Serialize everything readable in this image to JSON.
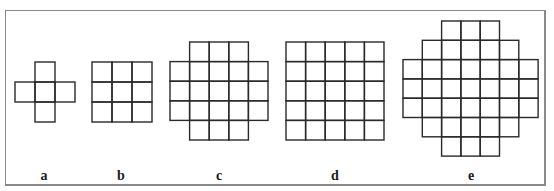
{
  "figure": {
    "line_color": "#2a2a2a",
    "frame_color": "#8a8a8a",
    "shapes": [
      {
        "id": "a",
        "label": "a",
        "origin": [
          15,
          62
        ],
        "cell": 20,
        "rows": [
          [
            1,
            1
          ],
          [
            0,
            2
          ],
          [
            1,
            1
          ]
        ],
        "label_x": 44
      },
      {
        "id": "b",
        "label": "b",
        "origin": [
          92,
          62
        ],
        "cell": 20,
        "rows": [
          [
            0,
            2
          ],
          [
            0,
            2
          ],
          [
            0,
            2
          ]
        ],
        "label_x": 121
      },
      {
        "id": "c",
        "label": "c",
        "origin": [
          170,
          42
        ],
        "cell": 19.6,
        "rows": [
          [
            1,
            3
          ],
          [
            0,
            4
          ],
          [
            0,
            4
          ],
          [
            0,
            4
          ],
          [
            1,
            3
          ]
        ],
        "label_x": 219
      },
      {
        "id": "d",
        "label": "d",
        "origin": [
          286,
          42
        ],
        "cell": 19.6,
        "rows": [
          [
            0,
            4
          ],
          [
            0,
            4
          ],
          [
            0,
            4
          ],
          [
            0,
            4
          ],
          [
            0,
            4
          ]
        ],
        "label_x": 335
      },
      {
        "id": "e",
        "label": "e",
        "origin": [
          403,
          21
        ],
        "cell": 19.3,
        "rows": [
          [
            2,
            4
          ],
          [
            1,
            5
          ],
          [
            0,
            6
          ],
          [
            0,
            6
          ],
          [
            0,
            6
          ],
          [
            1,
            5
          ],
          [
            2,
            4
          ]
        ],
        "label_x": 471
      }
    ]
  }
}
